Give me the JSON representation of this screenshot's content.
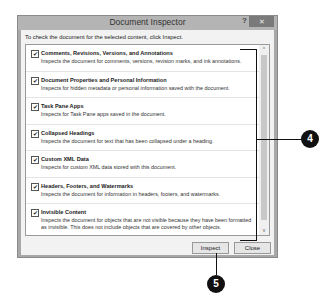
{
  "dialog": {
    "title": "Document Inspector",
    "help_label": "?",
    "close_label": "✕",
    "instruction": "To check the document for the selected content, click Inspect.",
    "items": [
      {
        "title": "Comments, Revisions, Versions, and Annotations",
        "description": "Inspects the document for comments, versions, revision marks, and ink annotations.",
        "checked": "✔"
      },
      {
        "title": "Document Properties and Personal Information",
        "description": "Inspects for hidden metadata or personal information saved with the document.",
        "checked": "✔"
      },
      {
        "title": "Task Pane Apps",
        "description": "Inspects for Task Pane apps saved in the document.",
        "checked": "✔"
      },
      {
        "title": "Collapsed Headings",
        "description": "Inspects the document for text that has been collapsed under a heading.",
        "checked": "✔"
      },
      {
        "title": "Custom XML Data",
        "description": "Inspects for custom XML data stored with this document.",
        "checked": "✔"
      },
      {
        "title": "Headers, Footers, and Watermarks",
        "description": "Inspects the document for information in headers, footers, and watermarks.",
        "checked": "✔"
      },
      {
        "title": "Invisible Content",
        "description": "Inspects the document for objects that are not visible because they have been formatted as invisible. This does not include objects that are covered by other objects.",
        "checked": "✔"
      }
    ],
    "scroll_up": "^",
    "scroll_down": "v",
    "inspect_label": "Inspect",
    "close_button_label": "Close"
  },
  "callouts": {
    "four": "4",
    "five": "5"
  }
}
